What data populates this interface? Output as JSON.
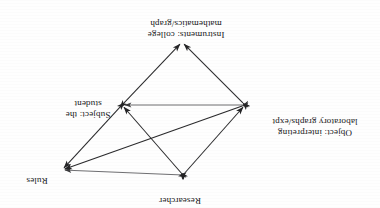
{
  "figure": {
    "orientation": "rotated-180",
    "colors": {
      "ink": "#18181a",
      "edge": "#2a2a2c",
      "edge_light": "#555558",
      "background": "#fefefe"
    }
  },
  "nodes": [
    {
      "id": "researcher",
      "lines": [
        "Researcher"
      ],
      "vertex": {
        "x": 197,
        "y": 33
      }
    },
    {
      "id": "rules",
      "lines": [
        "Rules"
      ],
      "vertex": {
        "x": 318,
        "y": 38
      }
    },
    {
      "id": "object",
      "lines": [
        "Object: interpreting",
        "laboratory graphs/expt"
      ],
      "vertex": {
        "x": 135,
        "y": 103
      }
    },
    {
      "id": "subject",
      "lines": [
        "Subject: the",
        "student"
      ],
      "vertex": {
        "x": 258,
        "y": 103
      }
    },
    {
      "id": "instruments",
      "lines": [
        "Instruments: college",
        "mathematics/graph"
      ],
      "vertex": {
        "x": 198,
        "y": 166
      }
    }
  ],
  "edges": [
    {
      "id": "researcher-rules",
      "from": "researcher",
      "to": "rules",
      "arrows": "both"
    },
    {
      "id": "researcher-object",
      "from": "researcher",
      "to": "object",
      "arrows": "both"
    },
    {
      "id": "researcher-subject",
      "from": "researcher",
      "to": "subject",
      "arrows": "both"
    },
    {
      "id": "object-rules",
      "from": "object",
      "to": "rules",
      "arrows": "both"
    },
    {
      "id": "object-subject",
      "from": "object",
      "to": "subject",
      "arrows": "both"
    },
    {
      "id": "subject-rules",
      "from": "subject",
      "to": "rules",
      "arrows": "both"
    },
    {
      "id": "object-instruments",
      "from": "object",
      "to": "instruments",
      "arrows": "both"
    },
    {
      "id": "subject-instruments",
      "from": "subject",
      "to": "instruments",
      "arrows": "both"
    }
  ]
}
